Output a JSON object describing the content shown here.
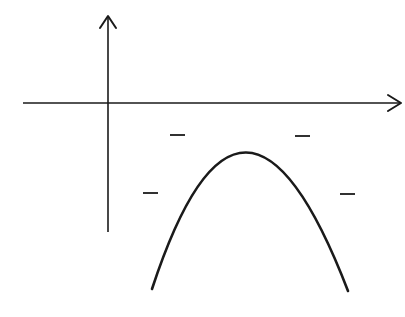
{
  "figure": {
    "background": "#ffffff",
    "stroke_color": "#1a1a1a",
    "axes": {
      "x_axis": {
        "x1": 23,
        "y": 103,
        "x2": 401,
        "arrow": "right"
      },
      "y_axis": {
        "x": 108,
        "y1": 232,
        "y2": 16,
        "arrow": "up"
      }
    },
    "curve": {
      "type": "parabola",
      "opens": "down",
      "vertex": [
        242,
        152
      ],
      "left_end": [
        152,
        289
      ],
      "right_end": [
        348,
        291
      ],
      "path": "M152,289 Q242,15 348,291"
    },
    "sign_marks": [
      {
        "symbol": "minus",
        "x1": 170,
        "x2": 185,
        "y": 135
      },
      {
        "symbol": "minus",
        "x1": 295,
        "x2": 310,
        "y": 136
      },
      {
        "symbol": "minus",
        "x1": 143,
        "x2": 158,
        "y": 193
      },
      {
        "symbol": "minus",
        "x1": 340,
        "x2": 355,
        "y": 194
      }
    ]
  }
}
